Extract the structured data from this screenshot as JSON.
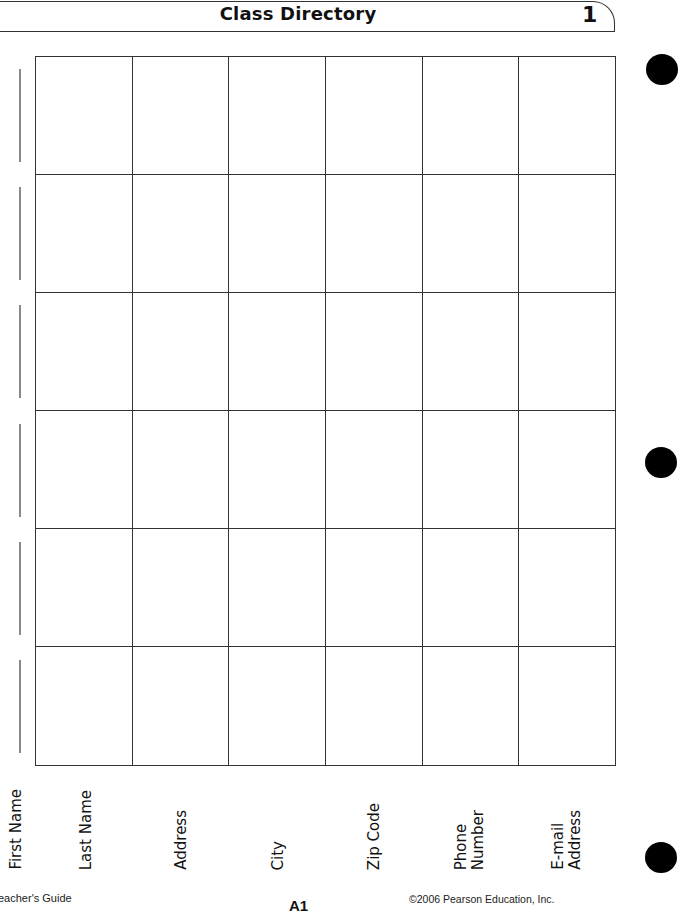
{
  "header": {
    "title": "Class Directory",
    "number": "1"
  },
  "table": {
    "columns": [
      "First Name",
      "Last Name",
      "Address",
      "City",
      "Zip Code",
      "Phone\nNumber",
      "E-mail\nAddress"
    ],
    "rows": 6,
    "cells": [
      [
        "",
        "",
        "",
        "",
        "",
        "",
        ""
      ],
      [
        "",
        "",
        "",
        "",
        "",
        "",
        ""
      ],
      [
        "",
        "",
        "",
        "",
        "",
        "",
        ""
      ],
      [
        "",
        "",
        "",
        "",
        "",
        "",
        ""
      ],
      [
        "",
        "",
        "",
        "",
        "",
        "",
        ""
      ],
      [
        "",
        "",
        "",
        "",
        "",
        "",
        ""
      ]
    ]
  },
  "footer": {
    "left": "eacher's Guide",
    "center": "A1",
    "right": "©2006 Pearson Education, Inc."
  }
}
